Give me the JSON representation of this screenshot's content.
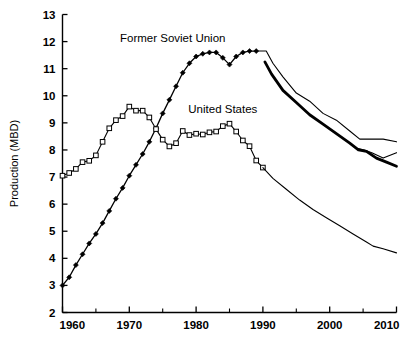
{
  "chart_data": {
    "type": "line",
    "title": "",
    "xlabel": "",
    "ylabel": "Production (MBD)",
    "xlim": [
      1960,
      2010
    ],
    "ylim": [
      2,
      13
    ],
    "grid": false,
    "legend_position": "inline-annotations",
    "xticks": [
      1960,
      1970,
      1980,
      1990,
      2000,
      2010
    ],
    "xtick_labels": [
      "1960",
      "1970",
      "1980",
      "1990",
      "2000",
      "2010"
    ],
    "xminor_ticks": [
      1965,
      1975,
      1985,
      1995,
      2005
    ],
    "yticks": [
      2,
      3,
      4,
      5,
      6,
      7,
      8,
      9,
      10,
      11,
      12,
      13
    ],
    "ytick_labels": [
      "2",
      "3",
      "4",
      "5",
      "6",
      "7",
      "8",
      "9",
      "10",
      "11",
      "12",
      "13"
    ],
    "annotations": [
      {
        "name": "former-soviet-union-label",
        "text": "Former Soviet Union",
        "x": 1976.5,
        "y": 12.0
      },
      {
        "name": "united-states-label",
        "text": "United States",
        "x": 1984.0,
        "y": 9.35
      }
    ],
    "series": [
      {
        "name": "Former Soviet Union",
        "marker": "filled-diamond",
        "linewidth": 1.3,
        "x": [
          1960,
          1961,
          1962,
          1963,
          1964,
          1965,
          1966,
          1967,
          1968,
          1969,
          1970,
          1971,
          1972,
          1973,
          1974,
          1975,
          1976,
          1977,
          1978,
          1979,
          1980,
          1981,
          1982,
          1983,
          1984,
          1985,
          1986,
          1987,
          1988,
          1989
        ],
        "y": [
          3.0,
          3.3,
          3.75,
          4.15,
          4.55,
          4.9,
          5.3,
          5.75,
          6.2,
          6.6,
          7.05,
          7.45,
          7.85,
          8.3,
          8.8,
          9.35,
          9.85,
          10.35,
          10.85,
          11.2,
          11.45,
          11.55,
          11.6,
          11.6,
          11.4,
          11.15,
          11.45,
          11.6,
          11.65,
          11.65
        ]
      },
      {
        "name": "United States",
        "marker": "open-square",
        "linewidth": 1.1,
        "x": [
          1960,
          1961,
          1962,
          1963,
          1964,
          1965,
          1966,
          1967,
          1968,
          1969,
          1970,
          1971,
          1972,
          1973,
          1974,
          1975,
          1976,
          1977,
          1978,
          1979,
          1980,
          1981,
          1982,
          1983,
          1984,
          1985,
          1986,
          1987,
          1988,
          1989,
          1990
        ],
        "y": [
          7.05,
          7.15,
          7.3,
          7.55,
          7.6,
          7.8,
          8.3,
          8.8,
          9.1,
          9.25,
          9.6,
          9.45,
          9.45,
          9.2,
          8.77,
          8.38,
          8.13,
          8.25,
          8.7,
          8.55,
          8.6,
          8.57,
          8.65,
          8.68,
          8.88,
          8.97,
          8.68,
          8.35,
          8.14,
          7.61,
          7.35
        ]
      },
      {
        "name": "Projection high",
        "marker": "none",
        "linewidth": 1.1,
        "x": [
          1989.0,
          1990.5,
          1991.5,
          1993,
          1995,
          1997,
          1999,
          2001,
          2003,
          2004.5,
          2006,
          2008,
          2010
        ],
        "y": [
          11.65,
          11.65,
          11.2,
          10.7,
          10.1,
          9.8,
          9.35,
          9.1,
          8.7,
          8.4,
          8.4,
          8.4,
          8.3
        ]
      },
      {
        "name": "Projection mid (bold)",
        "marker": "none",
        "linewidth": 2.8,
        "x": [
          1990.3,
          1991.3,
          1993,
          1995,
          1997,
          1999,
          2001,
          2003,
          2004.3,
          2005.5,
          2007,
          2008.5,
          2010
        ],
        "y": [
          11.25,
          10.8,
          10.2,
          9.75,
          9.3,
          8.95,
          8.6,
          8.25,
          8.0,
          7.95,
          7.7,
          7.55,
          7.4
        ]
      },
      {
        "name": "Projection low",
        "marker": "none",
        "linewidth": 1.1,
        "x": [
          2004.3,
          2005.2,
          2006.3,
          2008,
          2010
        ],
        "y": [
          8.05,
          8.0,
          7.9,
          7.7,
          7.9
        ]
      },
      {
        "name": "United States projection",
        "marker": "none",
        "linewidth": 1.1,
        "x": [
          1990,
          1991.5,
          1993.5,
          1995.5,
          1997.5,
          1999.5,
          2001.5,
          2003.5,
          2005.5,
          2006.5,
          2008,
          2010
        ],
        "y": [
          7.35,
          6.95,
          6.55,
          6.15,
          5.8,
          5.5,
          5.2,
          4.9,
          4.6,
          4.45,
          4.35,
          4.2
        ]
      }
    ]
  }
}
